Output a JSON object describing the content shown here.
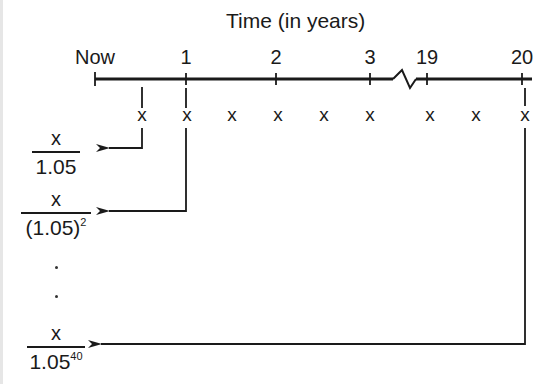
{
  "title": "Time (in years)",
  "timeline": {
    "ticks": [
      {
        "label": "Now",
        "x": 95
      },
      {
        "label": "1",
        "x": 186
      },
      {
        "label": "2",
        "x": 276
      },
      {
        "label": "3",
        "x": 370
      },
      {
        "label": "19",
        "x": 427
      },
      {
        "label": "20",
        "x": 522
      }
    ],
    "break_between": [
      "3",
      "19"
    ]
  },
  "payments": {
    "symbol": "x",
    "count_shown": 9
  },
  "present_values": [
    {
      "numerator": "x",
      "denominator": "1.05",
      "exponent": ""
    },
    {
      "numerator": "x",
      "denominator": "(1.05)",
      "exponent": "2"
    },
    {
      "numerator": "x",
      "denominator": "1.05",
      "exponent": "40"
    }
  ],
  "ellipsis": [
    ".",
    "."
  ],
  "colors": {
    "ink": "#1a1a1a",
    "background": "#ffffff"
  }
}
